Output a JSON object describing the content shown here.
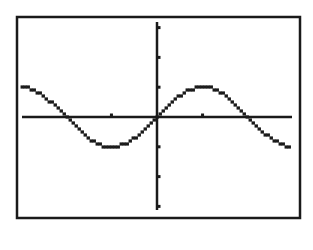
{
  "colors": {
    "background": "#ffffff",
    "frame": "#1a1a1a",
    "axis": "#1a1a1a",
    "curve": "#1a1a1a"
  },
  "chart_data": {
    "type": "line",
    "title": "",
    "xlabel": "",
    "ylabel": "",
    "function": "y = sin(x)",
    "xlim": [
      -4.65,
      4.65
    ],
    "ylim": [
      -3.1,
      3.25
    ],
    "x_tick_step": 1.5708,
    "y_tick_step": 1,
    "x_ticks": [
      -1.5708,
      1.5708
    ],
    "y_ticks": [
      -3,
      -2,
      -1,
      1,
      2,
      3
    ],
    "grid": false,
    "legend": null,
    "series": [
      {
        "name": "sin(x)",
        "x": [
          -4.65,
          -3.927,
          -3.1416,
          -2.3562,
          -1.5708,
          -0.7854,
          0,
          0.7854,
          1.5708,
          2.3562,
          3.1416,
          3.927,
          4.65
        ],
        "values": [
          1.0,
          0.707,
          0.0,
          -0.707,
          -1.0,
          -0.707,
          0.0,
          0.707,
          1.0,
          0.707,
          0.0,
          -0.707,
          -1.0
        ]
      }
    ],
    "key_points": {
      "zeros": [
        -3.1416,
        0,
        3.1416
      ],
      "maximum": [
        1.5708,
        1
      ],
      "minimum": [
        -1.5708,
        -1
      ]
    }
  },
  "layout": {
    "frame": {
      "x": 17,
      "y": 17,
      "width": 283,
      "height": 201
    },
    "origin_px": [
      157,
      117
    ],
    "x_axis_px": [
      22,
      292
    ],
    "y_axis_px": [
      22,
      210
    ],
    "px_per_x_unit": 29.0,
    "px_per_y_unit": 29.8
  }
}
